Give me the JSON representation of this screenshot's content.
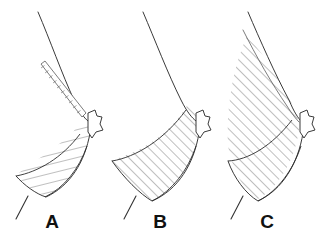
{
  "figure": {
    "type": "line-drawing",
    "background_color": "#ffffff",
    "stroke_color": "#3a3a3a",
    "hatch_color": "#555555",
    "label_color": "#111111",
    "panel_count": 3
  },
  "panels": [
    {
      "id": "panel-a",
      "label": "A",
      "label_x": 52,
      "label_y": 228,
      "hatch_pattern": "shallow-diagonal",
      "hatch_angle_degrees": 14,
      "has_strip": true,
      "strip_name": "duct-strip",
      "strip_rungs": 10,
      "description": "Lower breast region hatched with shallow near-horizontal lines; thin ladder-like strip runs from upper outline down to nipple."
    },
    {
      "id": "panel-b",
      "label": "B",
      "label_x": 160,
      "label_y": 228,
      "hatch_pattern": "diagonal-45",
      "hatch_angle_degrees": 45,
      "has_strip": false,
      "strip_name": "",
      "strip_rungs": 0,
      "description": "Lower and mid breast region hatched with 45 degree diagonal lines reaching the nipple."
    },
    {
      "id": "panel-c",
      "label": "C",
      "label_x": 267,
      "label_y": 228,
      "hatch_pattern": "diagonal-45",
      "hatch_angle_degrees": 45,
      "has_strip": false,
      "strip_name": "",
      "strip_rungs": 0,
      "description": "Entire breast parenchyma hatched with 45 degree diagonal lines from the upper pole down to the inframammary fold."
    }
  ],
  "anatomy_parts": {
    "breast_outline": "breast-outline",
    "nipple": "nipple",
    "chest_wall": "chest-wall-line",
    "inframammary_fold": "inframammary-fold",
    "hatched_region": "hatched-region"
  }
}
